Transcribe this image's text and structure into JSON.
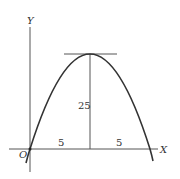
{
  "diagram": {
    "type": "parabola-plot",
    "axes": {
      "x_label": "X",
      "y_label": "Y",
      "origin_label": "O"
    },
    "annotations": {
      "height_label": "25",
      "left_half_label": "5",
      "right_half_label": "5"
    },
    "colors": {
      "curve": "#333333",
      "axis": "#555555",
      "background": "#ffffff"
    }
  }
}
